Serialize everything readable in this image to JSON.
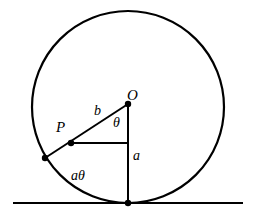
{
  "figure": {
    "background_color": "#ffffff",
    "stroke_color": "#000000",
    "width": 256,
    "height": 219
  },
  "labels": {
    "center": "O",
    "point_p": "P",
    "segment_b": "b",
    "angle_theta": "θ",
    "radius_a": "a",
    "arc_length": "aθ"
  },
  "geometry": {
    "circle": {
      "cx": 128,
      "cy": 107,
      "r": 96,
      "stroke_width": 2.2
    },
    "ground_line": {
      "x1": 13,
      "y1": 203,
      "x2": 243,
      "y2": 203,
      "stroke_width": 2.0
    },
    "radius_vertical": {
      "x1": 128,
      "y1": 104,
      "x2": 128,
      "y2": 203,
      "stroke_width": 2.0
    },
    "radius_oblique": {
      "x1": 128,
      "y1": 104,
      "x2": 45,
      "y2": 158,
      "stroke_width": 2.0
    },
    "horizontal_chord": {
      "x1": 71,
      "y1": 143,
      "x2": 128,
      "y2": 143,
      "stroke_width": 2.0
    },
    "points": [
      {
        "name": "center-O",
        "cx": 128,
        "cy": 104,
        "r": 3.2
      },
      {
        "name": "point-P",
        "cx": 71,
        "cy": 143,
        "r": 3.2
      },
      {
        "name": "circle-contact-left",
        "cx": 45,
        "cy": 158,
        "r": 3.2
      },
      {
        "name": "tangent-point",
        "cx": 128,
        "cy": 203,
        "r": 3.2
      }
    ]
  }
}
